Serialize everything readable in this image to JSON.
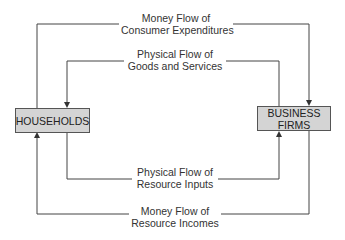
{
  "diagram": {
    "nodes": {
      "households": {
        "label": "HOUSEHOLDS"
      },
      "business": {
        "label_line1": "BUSINESS",
        "label_line2": "FIRMS"
      }
    },
    "flows": {
      "consumer_expenditures": {
        "line1": "Money Flow of",
        "line2": "Consumer Expenditures",
        "from": "HOUSEHOLDS",
        "to": "BUSINESS FIRMS"
      },
      "goods_services": {
        "line1": "Physical Flow of",
        "line2": "Goods and Services",
        "from": "BUSINESS FIRMS",
        "to": "HOUSEHOLDS"
      },
      "resource_inputs": {
        "line1": "Physical Flow of",
        "line2": "Resource Inputs",
        "from": "HOUSEHOLDS",
        "to": "BUSINESS FIRMS"
      },
      "resource_incomes": {
        "line1": "Money Flow of",
        "line2": "Resource Incomes",
        "from": "BUSINESS FIRMS",
        "to": "HOUSEHOLDS"
      }
    },
    "colors": {
      "box_fill": "#d4d4d4",
      "line": "#444444"
    }
  }
}
